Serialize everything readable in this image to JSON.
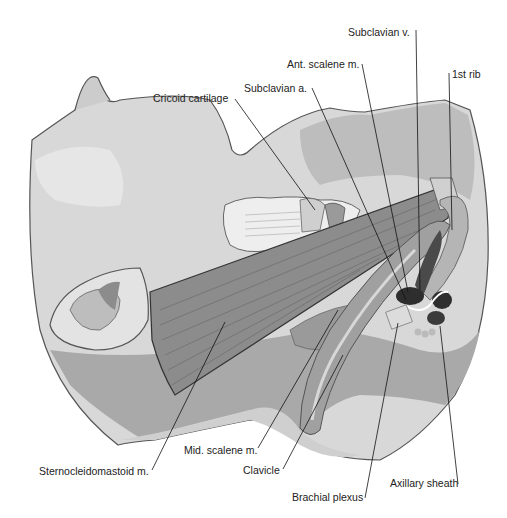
{
  "figure": {
    "colors": {
      "background": "#ffffff",
      "skin_light": "#dcdcdc",
      "skin_mid": "#c4c4c4",
      "skin_dark": "#a8a8a8",
      "muscle": "#8a8a8a",
      "muscle_dark": "#6a6a6a",
      "vessel_dark": "#3a3a3a",
      "outline": "#555555",
      "leader_line": "#111111",
      "label_text": "#222222"
    }
  },
  "labels": {
    "subclavian_v": "Subclavian v.",
    "ant_scalene": "Ant. scalene m.",
    "first_rib": "1st rib",
    "subclavian_a": "Subclavian a.",
    "cricoid": "Cricoid cartilage",
    "sternocleidomastoid": "Sternocleidomastoid m.",
    "mid_scalene": "Mid. scalene m.",
    "clavicle": "Clavicle",
    "brachial_plexus": "Brachial plexus",
    "axillary_sheath": "Axillary sheath"
  }
}
